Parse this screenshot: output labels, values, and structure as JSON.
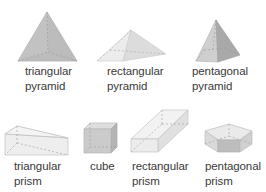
{
  "figure": {
    "colors": {
      "background": "#ffffff",
      "text": "#3a3a3a",
      "edge": "#bdbdbd",
      "hidden_edge": "#9a9a9a",
      "face_dark": "#b9b9b9",
      "face_mid": "#cdcdcd",
      "face_light": "#e6e6e6",
      "face_lighter": "#efefef"
    },
    "solids": [
      {
        "id": "triangular-pyramid",
        "line1": "triangular",
        "line2": "pyramid"
      },
      {
        "id": "rectangular-pyramid",
        "line1": "rectangular",
        "line2": "pyramid"
      },
      {
        "id": "pentagonal-pyramid",
        "line1": "pentagonal",
        "line2": "pyramid"
      },
      {
        "id": "triangular-prism",
        "line1": "triangular",
        "line2": "prism"
      },
      {
        "id": "cube",
        "line1": "cube",
        "line2": ""
      },
      {
        "id": "rectangular-prism",
        "line1": "rectangular",
        "line2": "prism"
      },
      {
        "id": "pentagonal-prism",
        "line1": "pentagonal",
        "line2": "prism"
      }
    ]
  }
}
